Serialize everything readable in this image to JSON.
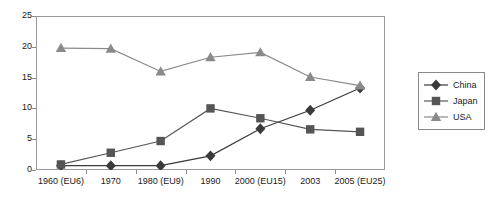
{
  "chart_data": {
    "type": "line",
    "title": "",
    "xlabel": "",
    "ylabel": "",
    "ylim": [
      0,
      25
    ],
    "yticks": [
      0,
      5,
      10,
      15,
      20,
      25
    ],
    "grid": false,
    "legend_position": "right",
    "categories": [
      "1960 (EU6)",
      "1970",
      "1980 (EU9)",
      "1990",
      "2000 (EU15)",
      "2003",
      "2005 (EU25)"
    ],
    "series": [
      {
        "name": "China",
        "marker": "diamond",
        "color": "#3a3a3a",
        "values": [
          0.7,
          0.7,
          0.7,
          2.3,
          6.7,
          9.7,
          13.3
        ]
      },
      {
        "name": "Japan",
        "marker": "square",
        "color": "#555555",
        "values": [
          0.9,
          2.8,
          4.7,
          10.0,
          8.4,
          6.6,
          6.2
        ]
      },
      {
        "name": "USA",
        "marker": "triangle",
        "color": "#8a8a8a",
        "values": [
          19.8,
          19.7,
          16.0,
          18.3,
          19.1,
          15.1,
          13.7
        ]
      }
    ]
  },
  "axes": {
    "y_tick_labels": [
      "0",
      "5",
      "10",
      "15",
      "20",
      "25"
    ],
    "x_tick_labels": [
      "1960 (EU6)",
      "1970",
      "1980 (EU9)",
      "1990",
      "2000 (EU15)",
      "2003",
      "2005 (EU25)"
    ]
  },
  "legend": {
    "entries": [
      {
        "label": "China",
        "marker": "diamond",
        "color": "#3a3a3a"
      },
      {
        "label": "Japan",
        "marker": "square",
        "color": "#555555"
      },
      {
        "label": "USA",
        "marker": "triangle",
        "color": "#8a8a8a"
      }
    ]
  }
}
